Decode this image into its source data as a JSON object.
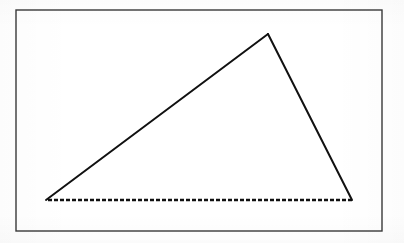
{
  "figure": {
    "title": "Triangle inscribed in a rectangular frame",
    "canvas": {
      "width": 404,
      "height": 243,
      "background": "#ffffff"
    },
    "frame": {
      "label": "rectangular border",
      "x": 16,
      "y": 10,
      "width": 366,
      "height": 221,
      "stroke_color": "#3a3a3a",
      "stroke_width": 1.4,
      "fill": "none"
    },
    "triangle": {
      "label": "triangle",
      "fill": "none",
      "vertices": [
        {
          "name": "apex",
          "x": 268,
          "y": 34
        },
        {
          "name": "bottom-right",
          "x": 352,
          "y": 200
        },
        {
          "name": "bottom-left",
          "x": 46,
          "y": 200
        }
      ],
      "edges": [
        {
          "name": "hypotenuse-left",
          "from": "bottom-left",
          "to": "apex",
          "style": "solid",
          "stroke_color": "#111111",
          "stroke_width": 2.0
        },
        {
          "name": "side-right",
          "from": "apex",
          "to": "bottom-right",
          "style": "solid",
          "stroke_color": "#111111",
          "stroke_width": 2.0
        },
        {
          "name": "base-bottom",
          "from": "bottom-right",
          "to": "bottom-left",
          "style": "dashed",
          "stroke_color": "#111111",
          "stroke_width": 2.6,
          "dash_length": 4,
          "gap_length": 2
        }
      ]
    }
  }
}
